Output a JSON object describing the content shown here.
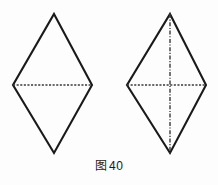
{
  "figure": {
    "caption_label": "图",
    "caption_number": "40",
    "caption_full": "图 40",
    "background_color": "#fdfdfd",
    "stroke_color": "#1a1a1a",
    "dash_color": "#3a3a3a",
    "canvas": {
      "width": 218,
      "height": 185
    },
    "shapes": [
      {
        "name": "left-rhombus",
        "description": "rhombus with single horizontal dashed diagonal",
        "vertices": {
          "top": [
            54,
            14
          ],
          "right": [
            92,
            85
          ],
          "bottom": [
            54,
            153
          ],
          "left": [
            13,
            85
          ]
        },
        "outline_points": "54,14 92,85 54,153 13,85",
        "diagonals": [
          {
            "name": "horizontal-diagonal",
            "style": "dashed",
            "x1": 13,
            "y1": 85,
            "x2": 92,
            "y2": 85
          }
        ]
      },
      {
        "name": "right-rhombus",
        "description": "rhombus with horizontal and vertical dashed diagonals",
        "vertices": {
          "top": [
            170,
            14
          ],
          "right": [
            206,
            85
          ],
          "bottom": [
            170,
            153
          ],
          "left": [
            127,
            85
          ]
        },
        "outline_points": "170,14 206,85 170,153 127,85",
        "diagonals": [
          {
            "name": "horizontal-diagonal",
            "style": "dashed",
            "x1": 127,
            "y1": 85,
            "x2": 206,
            "y2": 85
          },
          {
            "name": "vertical-diagonal",
            "style": "dash-dot",
            "x1": 170,
            "y1": 14,
            "x2": 170,
            "y2": 153
          }
        ]
      }
    ]
  }
}
